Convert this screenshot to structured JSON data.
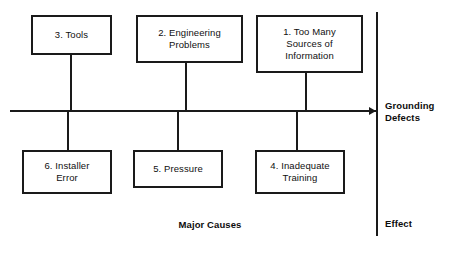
{
  "diagram": {
    "type": "fishbone-ishikawa",
    "spine": {
      "x_start": 10,
      "x_end": 376,
      "y": 110,
      "arrow_direction": "right"
    },
    "effect_line": {
      "x": 376,
      "y_start": 12,
      "y_end": 236
    },
    "causes_top": [
      {
        "id": "cause-3",
        "text": "3. Tools",
        "box": {
          "x": 31,
          "y": 15,
          "w": 81,
          "h": 40
        },
        "stem_x": 71
      },
      {
        "id": "cause-2",
        "text": "2. Engineering\nProblems",
        "box": {
          "x": 136,
          "y": 15,
          "w": 107,
          "h": 48
        },
        "stem_x": 186
      },
      {
        "id": "cause-1",
        "text": "1. Too Many\nSources of\nInformation",
        "box": {
          "x": 256,
          "y": 15,
          "w": 107,
          "h": 58
        },
        "stem_x": 306
      }
    ],
    "causes_bottom": [
      {
        "id": "cause-6",
        "text": "6. Installer\nError",
        "box": {
          "x": 22,
          "y": 150,
          "w": 90,
          "h": 44
        },
        "stem_x": 68
      },
      {
        "id": "cause-5",
        "text": "5. Pressure",
        "box": {
          "x": 133,
          "y": 150,
          "w": 90,
          "h": 38
        },
        "stem_x": 178
      },
      {
        "id": "cause-4",
        "text": "4. Inadequate\nTraining",
        "box": {
          "x": 255,
          "y": 150,
          "w": 90,
          "h": 44
        },
        "stem_x": 297
      }
    ],
    "labels": {
      "effect_title": "Grounding\nDefects",
      "major_causes": "Major Causes",
      "effect_caption": "Effect"
    },
    "colors": {
      "stroke": "#1a1a1a",
      "text": "#101010",
      "background": "#ffffff"
    }
  }
}
